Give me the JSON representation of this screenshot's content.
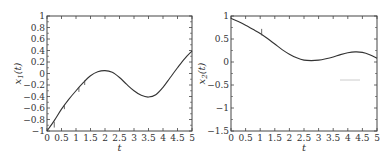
{
  "chart_data": [
    {
      "type": "line",
      "title": "",
      "xlabel": "t",
      "ylabel": "x_1(t)",
      "xlim": [
        0,
        5
      ],
      "ylim": [
        -1,
        1
      ],
      "xticks": [
        "0",
        "0.5",
        "1",
        "1.5",
        "2",
        "2.5",
        "3",
        "3.5",
        "4",
        "4.5",
        "5"
      ],
      "yticks": [
        "-1",
        "-0.8",
        "-0.6",
        "-0.4",
        "-0.2",
        "0",
        "0.2",
        "0.4",
        "0.6",
        "0.8",
        "1"
      ],
      "grid": false,
      "series": [
        {
          "name": "x1",
          "x": [
            0,
            0.25,
            0.5,
            0.75,
            1,
            1.25,
            1.5,
            1.75,
            2,
            2.25,
            2.5,
            2.75,
            3,
            3.25,
            3.5,
            3.75,
            4,
            4.25,
            4.5,
            4.75,
            5
          ],
          "y": [
            -1,
            -0.82,
            -0.62,
            -0.45,
            -0.3,
            -0.16,
            -0.04,
            0.03,
            0.05,
            0.02,
            -0.07,
            -0.19,
            -0.3,
            -0.38,
            -0.41,
            -0.37,
            -0.24,
            -0.07,
            0.1,
            0.26,
            0.39
          ]
        }
      ],
      "annotations": [
        "short vertical markers near t=0.25, 0.6, 1.1, 1.3"
      ]
    },
    {
      "type": "line",
      "title": "",
      "xlabel": "t",
      "ylabel": "x_2(t)",
      "xlim": [
        0,
        5
      ],
      "ylim": [
        -1.5,
        1
      ],
      "xticks": [
        "0",
        "0.5",
        "1",
        "1.5",
        "2",
        "2.5",
        "3",
        "3.5",
        "4",
        "4.5",
        "5"
      ],
      "yticks": [
        "-1.5",
        "-1",
        "-0.5",
        "0",
        "0.5",
        "1"
      ],
      "grid": false,
      "series": [
        {
          "name": "x2",
          "x": [
            0,
            0.25,
            0.5,
            0.75,
            1,
            1.25,
            1.5,
            1.75,
            2,
            2.25,
            2.5,
            2.75,
            3,
            3.25,
            3.5,
            3.75,
            4,
            4.25,
            4.5,
            4.75,
            5
          ],
          "y": [
            0.95,
            0.88,
            0.8,
            0.71,
            0.62,
            0.51,
            0.39,
            0.27,
            0.17,
            0.09,
            0.04,
            0.03,
            0.04,
            0.07,
            0.11,
            0.16,
            0.2,
            0.22,
            0.21,
            0.16,
            0.08
          ]
        }
      ],
      "annotations": [
        "short vertical marker near t=1.05"
      ]
    }
  ]
}
